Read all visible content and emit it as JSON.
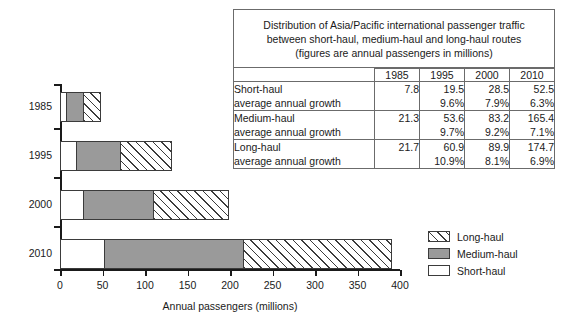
{
  "chart_data": {
    "type": "bar",
    "orientation": "horizontal",
    "stacked": true,
    "title": "",
    "xlabel": "Annual passengers (millions)",
    "ylabel": "",
    "xlim": [
      0,
      400
    ],
    "xticks": [
      "0",
      "50",
      "100",
      "150",
      "200",
      "250",
      "300",
      "350",
      "400"
    ],
    "categories": [
      "1985",
      "1995",
      "2000",
      "2010"
    ],
    "grid": false,
    "legend_position": "right",
    "series": [
      {
        "name": "Short-haul",
        "values": [
          7.8,
          19.5,
          28.5,
          52.5
        ],
        "color": "#ffffff",
        "pattern": "solid-white"
      },
      {
        "name": "Medium-haul",
        "values": [
          21.3,
          53.6,
          83.2,
          165.4
        ],
        "color": "#9a9a9a",
        "pattern": "solid-gray"
      },
      {
        "name": "Long-haul",
        "values": [
          21.7,
          60.9,
          89.9,
          174.7
        ],
        "color": "#ffffff",
        "pattern": "diagonal-hatch"
      }
    ],
    "totals": [
      50.8,
      134.0,
      201.6,
      392.6
    ]
  },
  "legend": {
    "items": [
      {
        "label": "Long-haul",
        "swatch": "diagonal-hatch"
      },
      {
        "label": "Medium-haul",
        "swatch": "solid-gray"
      },
      {
        "label": "Short-haul",
        "swatch": "solid-white"
      }
    ]
  },
  "axis": {
    "x_title": "Annual passengers (millions)",
    "x_ticks": [
      "0",
      "50",
      "100",
      "150",
      "200",
      "250",
      "300",
      "350",
      "400"
    ],
    "y_categories": [
      "1985",
      "1995",
      "2000",
      "2010"
    ]
  },
  "table": {
    "title_line1": "Distribution of Asia/Pacific international passenger traffic",
    "title_line2": "between short-haul, medium-haul and long-haul routes",
    "title_line3": "(figures are annual passengers in millions)",
    "corner_header": "",
    "year_headers": [
      "1985",
      "1995",
      "2000",
      "2010"
    ],
    "rows": [
      {
        "name": "Short-haul",
        "sub": "average annual growth",
        "values": [
          "7.8",
          "19.5",
          "28.5",
          "52.5"
        ],
        "growth": [
          "",
          "9.6%",
          "7.9%",
          "6.3%"
        ]
      },
      {
        "name": "Medium-haul",
        "sub": "average annual growth",
        "values": [
          "21.3",
          "53.6",
          "83.2",
          "165.4"
        ],
        "growth": [
          "",
          "9.7%",
          "9.2%",
          "7.1%"
        ]
      },
      {
        "name": "Long-haul",
        "sub": "average annual growth",
        "values": [
          "21.7",
          "60.9",
          "89.9",
          "174.7"
        ],
        "growth": [
          "",
          "10.9%",
          "8.1%",
          "6.9%"
        ]
      }
    ]
  }
}
